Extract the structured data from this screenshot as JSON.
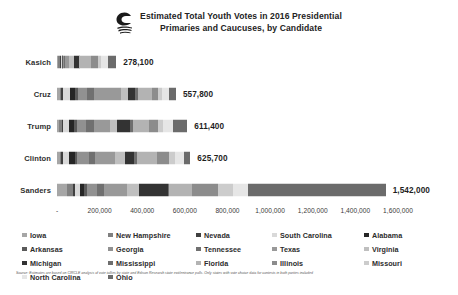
{
  "header": {
    "logo_icon": "circle-wave-logo-icon",
    "title_line1": "Estimated Total Youth Votes in 2016 Presidential",
    "title_line2": "Primaries and Caucuses, by Candidate"
  },
  "footnote": {
    "text": "Source:  Estimates are based on CIRCLE analysis of vote tallies by state and Edison Research state exit/entrance polls.  Only states with vote choice data for contests in both parties included"
  },
  "chart_data": {
    "type": "bar",
    "orientation": "horizontal",
    "stacked": true,
    "title": "Estimated Total Youth Votes in 2016 Presidential Primaries and Caucuses, by Candidate",
    "xlabel": "",
    "ylabel": "",
    "xlim": [
      0,
      1600000
    ],
    "xticks": [
      0,
      200000,
      400000,
      600000,
      800000,
      1000000,
      1200000,
      1400000,
      1600000
    ],
    "xticklabels": [
      "-",
      "200,000",
      "400,000",
      "600,000",
      "800,000",
      "1,000,000",
      "1,200,000",
      "1,400,000",
      "1,600,000"
    ],
    "grid": false,
    "legend_position": "bottom",
    "categories": [
      "Kasich",
      "Cruz",
      "Trump",
      "Clinton",
      "Sanders"
    ],
    "totals": [
      278100,
      557800,
      611400,
      625700,
      1542000
    ],
    "total_labels": [
      "278,100",
      "557,800",
      "611,400",
      "625,700",
      "1,542,000"
    ],
    "series": [
      {
        "name": "Iowa",
        "color": "#a6a6a6",
        "values": [
          3000,
          16000,
          10000,
          12000,
          48000
        ]
      },
      {
        "name": "New Hampshire",
        "color": "#808080",
        "values": [
          13000,
          5000,
          14000,
          9000,
          26000
        ]
      },
      {
        "name": "Nevada",
        "color": "#404040",
        "values": [
          2000,
          7000,
          6000,
          5000,
          12000
        ]
      },
      {
        "name": "South Carolina",
        "color": "#d9d9d9",
        "values": [
          4000,
          33000,
          27000,
          32000,
          24000
        ]
      },
      {
        "name": "Alabama",
        "color": "#262626",
        "values": [
          3000,
          22000,
          24000,
          25000,
          19000
        ]
      },
      {
        "name": "Arkansas",
        "color": "#5a5a5a",
        "values": [
          2000,
          14000,
          11000,
          13000,
          12000
        ]
      },
      {
        "name": "Georgia",
        "color": "#919191",
        "values": [
          7000,
          46000,
          45000,
          52000,
          45000
        ]
      },
      {
        "name": "Tennessee",
        "color": "#707070",
        "values": [
          5000,
          33000,
          38000,
          30000,
          34000
        ]
      },
      {
        "name": "Texas",
        "color": "#999999",
        "values": [
          16000,
          126000,
          72000,
          94000,
          111000
        ]
      },
      {
        "name": "Virginia",
        "color": "#bfbfbf",
        "values": [
          26000,
          30000,
          36000,
          48000,
          53000
        ]
      },
      {
        "name": "Michigan",
        "color": "#333333",
        "values": [
          22000,
          34000,
          58000,
          41000,
          136000
        ]
      },
      {
        "name": "Mississippi",
        "color": "#6e6e6e",
        "values": [
          1000,
          13000,
          14000,
          17000,
          8000
        ]
      },
      {
        "name": "Florida",
        "color": "#b3b3b3",
        "values": [
          54000,
          68000,
          78000,
          93000,
          108000
        ]
      },
      {
        "name": "Illinois",
        "color": "#8c8c8c",
        "values": [
          34000,
          26000,
          42000,
          56000,
          120000
        ]
      },
      {
        "name": "Missouri",
        "color": "#cccccc",
        "values": [
          15000,
          20000,
          24000,
          29000,
          68000
        ]
      },
      {
        "name": "North Carolina",
        "color": "#e6e6e6",
        "values": [
          32000,
          31000,
          48000,
          39000,
          72000
        ]
      },
      {
        "name": "Ohio",
        "color": "#6b6b6b",
        "values": [
          39100,
          33800,
          64400,
          30700,
          646000
        ]
      }
    ]
  }
}
